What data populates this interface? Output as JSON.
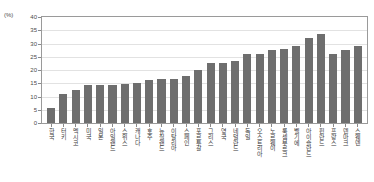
{
  "chart_data": {
    "type": "bar",
    "title": "",
    "subtitle": "",
    "xlabel": "",
    "ylabel": "",
    "unit_label": "(%)",
    "ylim": [
      0,
      40
    ],
    "ytick_step": 5,
    "yticks": [
      "0",
      "5",
      "10",
      "15",
      "20",
      "25",
      "30",
      "35",
      "40"
    ],
    "grid": true,
    "legend": "none",
    "bar_color": "#6e6e6e",
    "sorted": "ascending",
    "categories": [
      "한국",
      "터키",
      "멕시코",
      "미국",
      "일본",
      "아일랜드",
      "스위스",
      "캐나다",
      "호주",
      "뉴질랜드",
      "이탈리아",
      "스페인",
      "포르투갈",
      "그리스",
      "영국",
      "네덜란드",
      "독일",
      "오스트리아",
      "노르웨이",
      "룩셈부르크",
      "벨기에",
      "아이슬란드",
      "핀란드",
      "프랑스",
      "덴마크",
      "스웨덴"
    ],
    "values": [
      5.7,
      11.0,
      12.3,
      14.2,
      14.2,
      14.4,
      14.8,
      15.2,
      16.3,
      16.6,
      16.6,
      17.9,
      19.9,
      22.5,
      22.7,
      23.5,
      26.2,
      26.2,
      27.5,
      27.9,
      29.2,
      32.2,
      33.7,
      26.2,
      27.5,
      29.2
    ]
  }
}
